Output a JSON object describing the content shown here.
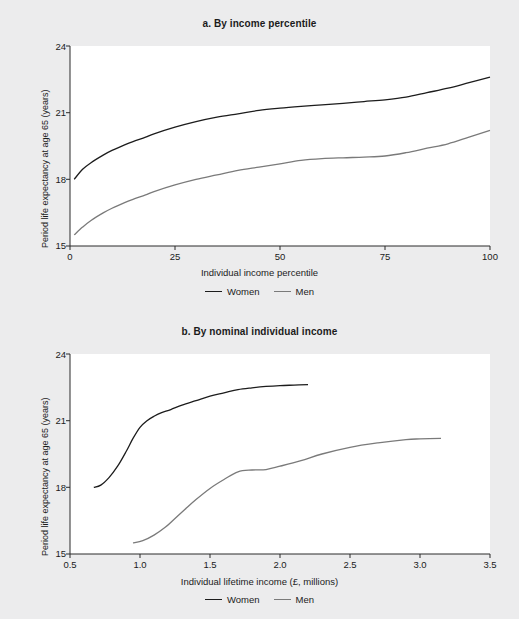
{
  "figure": {
    "background_color": "#ececed",
    "plot_background_color": "#ffffff",
    "axis_color": "#2a2a2a"
  },
  "series_colors": {
    "women": "#1c1c1c",
    "men": "#7a7a7a"
  },
  "legend": {
    "women_label": "Women",
    "men_label": "Men"
  },
  "panel_a": {
    "title": "a. By income percentile",
    "ylabel": "Period life expectancy at age 65 (years)",
    "xlabel": "Individual income percentile",
    "yticks": [
      "24",
      "21",
      "18",
      "15"
    ],
    "xticks": [
      "0",
      "25",
      "50",
      "75",
      "100"
    ]
  },
  "panel_b": {
    "title": "b. By nominal individual income",
    "ylabel": "Period life expectancy at age 65 (years)",
    "xlabel": "Individual lifetime income (£, millions)",
    "yticks": [
      "24",
      "21",
      "18",
      "15"
    ],
    "xticks": [
      "0.5",
      "1.0",
      "1.5",
      "2.0",
      "2.5",
      "3.0",
      "3.5"
    ]
  },
  "chart_data": [
    {
      "type": "line",
      "title": "a. By income percentile",
      "xlabel": "Individual income percentile",
      "ylabel": "Period life expectancy at age 65 (years)",
      "xlim": [
        0,
        100
      ],
      "ylim": [
        15,
        24
      ],
      "xticks": [
        0,
        25,
        50,
        75,
        100
      ],
      "yticks": [
        15,
        18,
        21,
        24
      ],
      "grid": false,
      "legend": "bottom",
      "series": [
        {
          "name": "Women",
          "color": "#1c1c1c",
          "x": [
            1,
            3,
            5,
            8,
            10,
            13,
            15,
            18,
            20,
            25,
            30,
            35,
            40,
            45,
            50,
            55,
            60,
            65,
            70,
            75,
            80,
            85,
            90,
            95,
            100
          ],
          "values": [
            18.0,
            18.45,
            18.75,
            19.1,
            19.3,
            19.55,
            19.7,
            19.9,
            20.05,
            20.35,
            20.6,
            20.8,
            20.95,
            21.1,
            21.2,
            21.28,
            21.35,
            21.42,
            21.5,
            21.58,
            21.7,
            21.9,
            22.1,
            22.35,
            22.6
          ]
        },
        {
          "name": "Men",
          "color": "#7a7a7a",
          "x": [
            1,
            3,
            5,
            8,
            10,
            13,
            15,
            18,
            20,
            25,
            30,
            35,
            40,
            45,
            50,
            55,
            60,
            65,
            70,
            75,
            80,
            85,
            90,
            95,
            100
          ],
          "values": [
            15.5,
            15.85,
            16.15,
            16.5,
            16.7,
            16.95,
            17.1,
            17.3,
            17.45,
            17.75,
            18.0,
            18.2,
            18.4,
            18.55,
            18.7,
            18.85,
            18.93,
            18.97,
            19.0,
            19.05,
            19.2,
            19.4,
            19.6,
            19.9,
            20.2
          ]
        }
      ]
    },
    {
      "type": "line",
      "title": "b. By nominal individual income",
      "xlabel": "Individual lifetime income (£, millions)",
      "ylabel": "Period life expectancy at age 65 (years)",
      "xlim": [
        0.5,
        3.5
      ],
      "ylim": [
        15,
        24
      ],
      "xticks": [
        0.5,
        1.0,
        1.5,
        2.0,
        2.5,
        3.0,
        3.5
      ],
      "yticks": [
        15,
        18,
        21,
        24
      ],
      "grid": false,
      "legend": "bottom",
      "series": [
        {
          "name": "Women",
          "color": "#1c1c1c",
          "x": [
            0.67,
            0.72,
            0.78,
            0.84,
            0.9,
            0.95,
            1.0,
            1.05,
            1.1,
            1.15,
            1.22,
            1.3,
            1.4,
            1.5,
            1.6,
            1.7,
            1.8,
            1.9,
            2.0,
            2.1,
            2.2
          ],
          "values": [
            18.0,
            18.1,
            18.45,
            18.95,
            19.6,
            20.2,
            20.7,
            21.0,
            21.2,
            21.35,
            21.5,
            21.7,
            21.9,
            22.1,
            22.25,
            22.4,
            22.48,
            22.54,
            22.58,
            22.6,
            22.62
          ]
        },
        {
          "name": "Men",
          "color": "#7a7a7a",
          "x": [
            0.95,
            1.02,
            1.1,
            1.18,
            1.25,
            1.32,
            1.4,
            1.5,
            1.6,
            1.7,
            1.8,
            1.9,
            2.0,
            2.15,
            2.3,
            2.5,
            2.7,
            2.9,
            3.0,
            3.15
          ],
          "values": [
            15.5,
            15.6,
            15.85,
            16.2,
            16.6,
            17.0,
            17.45,
            17.95,
            18.35,
            18.7,
            18.78,
            18.8,
            18.95,
            19.2,
            19.5,
            19.8,
            20.0,
            20.15,
            20.18,
            20.2
          ]
        }
      ]
    }
  ]
}
